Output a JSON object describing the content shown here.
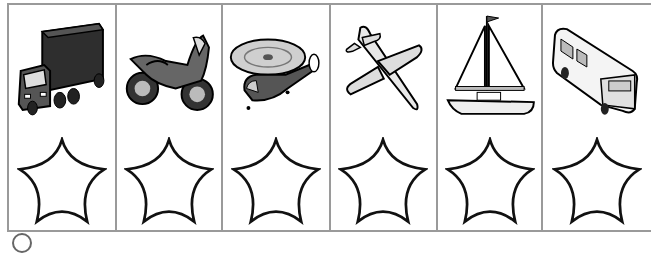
{
  "worksheet": {
    "columns": [
      {
        "vehicle": "truck",
        "icon": "truck-icon"
      },
      {
        "vehicle": "motorcycle",
        "icon": "motorcycle-icon"
      },
      {
        "vehicle": "helicopter",
        "icon": "helicopter-icon"
      },
      {
        "vehicle": "airplane",
        "icon": "airplane-icon"
      },
      {
        "vehicle": "sailboat",
        "icon": "sailboat-icon"
      },
      {
        "vehicle": "bus",
        "icon": "bus-icon"
      }
    ],
    "star_count": 6,
    "colors": {
      "border": "#9a9a9a",
      "ink": "#111111",
      "dark_fill": "#3a3a3a",
      "mid_fill": "#6a6a6a",
      "light_fill": "#d8d8d8"
    }
  }
}
